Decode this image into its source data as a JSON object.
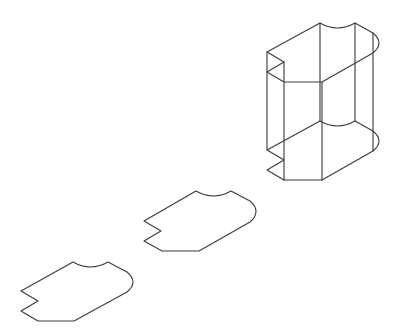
{
  "figure": {
    "stroke_color": "#3a3a3a",
    "background": "#ffffff"
  },
  "shapes": {
    "profile_bottom": {
      "label": "",
      "path": "M73,262 Q90.5,272 108,262 L127,272 Q139,282 127,292 L74,321 L38,321 L21,311 L38,301 L21,291 Z"
    },
    "profile_middle": {
      "label": "",
      "path": "M196,191 Q213.5,201 231,191 L250,201 Q262,211.5 250,222 L199,251 L162,251 L144,241 L161,231 L144,221 Z"
    },
    "prism": {
      "label": "",
      "top_face": "M320,23 Q337.5,33 355,23 L373,33 Q385,43 373,53 L322,82 L284,82 L267,72 L284,62 L267,52 Z",
      "bottom_face": "M320,121 Q337.5,131 355,121 L373,131 Q385,141 373,151 L322,180 L284,180 L267,170 L284,160 L267,150 Z",
      "vertical_edges": "M267,52 L267,150 M284,62 L284,160 M284,82 L284,180 M322,82 L322,180 M320,23 L320,121 M355,23 L355,121 M373,33 L373,131 M373,53 L373,151"
    }
  }
}
